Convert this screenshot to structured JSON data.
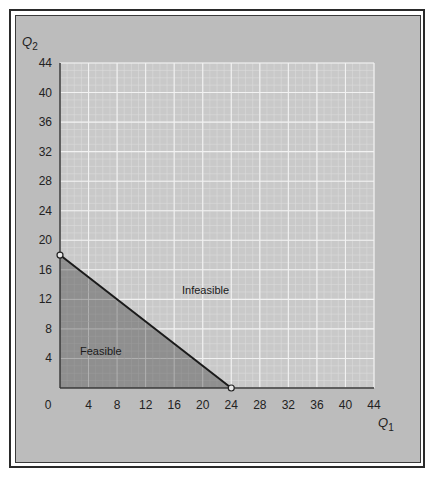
{
  "chart_data": {
    "type": "area",
    "title": "",
    "xlabel": "Q1",
    "ylabel": "Q2",
    "xlim": [
      0,
      44
    ],
    "ylim": [
      0,
      44
    ],
    "x_ticks": [
      0,
      4,
      8,
      12,
      16,
      20,
      24,
      28,
      32,
      36,
      40,
      44
    ],
    "y_ticks": [
      4,
      8,
      12,
      16,
      20,
      24,
      28,
      32,
      36,
      40,
      44
    ],
    "grid": true,
    "constraint_line": {
      "points": [
        [
          0,
          18
        ],
        [
          24,
          0
        ]
      ],
      "equation": "Q2 = 18 - 0.75*Q1"
    },
    "regions": [
      {
        "name": "Feasible",
        "vertices": [
          [
            0,
            0
          ],
          [
            0,
            18
          ],
          [
            24,
            0
          ]
        ],
        "shaded": true
      },
      {
        "name": "Infeasible",
        "shaded": false
      }
    ],
    "annotations": [
      {
        "text": "Feasible",
        "x": 5,
        "y": 5
      },
      {
        "text": "Infeasible",
        "x": 20,
        "y": 13.5
      }
    ],
    "marked_points": [
      [
        0,
        18
      ],
      [
        24,
        0
      ]
    ]
  },
  "axis": {
    "x_label_main": "Q",
    "x_label_sub": "1",
    "y_label_main": "Q",
    "y_label_sub": "2"
  },
  "labels": {
    "feasible": "Feasible",
    "infeasible": "Infeasible"
  },
  "colors": {
    "panel": "#bcbcbc",
    "plot_bg": "#c9c9c9",
    "grid_major": "#f2f2f2",
    "grid_minor": "#dcdcdc",
    "feasible_fill": "#8f8f8f",
    "line": "#1a1a1a"
  }
}
